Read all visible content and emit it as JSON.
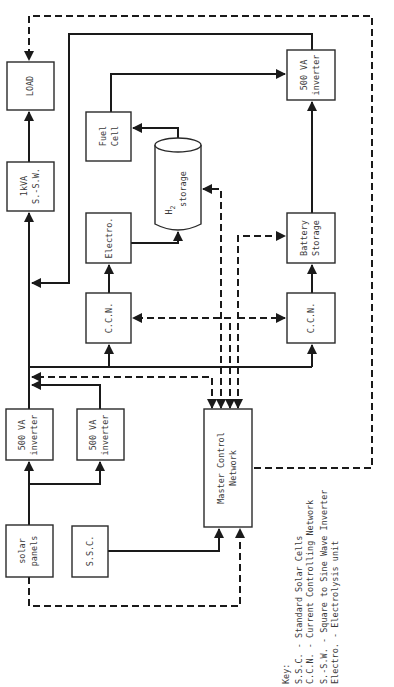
{
  "diagram": {
    "orientation": "rotated 90 degrees counter-clockwise",
    "blocks": {
      "load": {
        "line1": "LOAD"
      },
      "sine_inverter": {
        "line1": "1kVA",
        "line2": "S.-S.W."
      },
      "fuel_cell": {
        "line1": "Fuel",
        "line2": "Cell"
      },
      "h2_storage": {
        "line1": "H",
        "sub": "2",
        "line2": "storage"
      },
      "electrolysis": {
        "line1": "Electro."
      },
      "ccn_left": {
        "line1": "C.C.N."
      },
      "inverter_top": {
        "line1": "500 VA",
        "line2": "inverter"
      },
      "battery": {
        "line1": "Battery",
        "line2": "Storage"
      },
      "ccn_right": {
        "line1": "C.C.N."
      },
      "inverter_a": {
        "line1": "500 VA",
        "line2": "inverter"
      },
      "inverter_b": {
        "line1": "500 VA",
        "line2": "inverter"
      },
      "master_control": {
        "line1": "Master Control",
        "line2": "Network"
      },
      "solar_panels": {
        "line1": "solar",
        "line2": "panels"
      },
      "ssc": {
        "line1": "S.S.C."
      }
    },
    "connections": [
      {
        "from": "solar_panels",
        "to": "inverter_a",
        "type": "power"
      },
      {
        "from": "solar_panels",
        "to": "inverter_b",
        "type": "power"
      },
      {
        "from": "inverter_a",
        "to": "dc_bus",
        "type": "power"
      },
      {
        "from": "inverter_b",
        "to": "dc_bus",
        "type": "power"
      },
      {
        "from": "dc_bus",
        "to": "ccn_left",
        "type": "power"
      },
      {
        "from": "dc_bus",
        "to": "ccn_right",
        "type": "power"
      },
      {
        "from": "ccn_left",
        "to": "electrolysis",
        "type": "power"
      },
      {
        "from": "electrolysis",
        "to": "h2_storage",
        "type": "power"
      },
      {
        "from": "h2_storage",
        "to": "fuel_cell",
        "type": "power"
      },
      {
        "from": "fuel_cell",
        "to": "inverter_top",
        "type": "power"
      },
      {
        "from": "ccn_right",
        "to": "battery",
        "type": "power"
      },
      {
        "from": "battery",
        "to": "inverter_top",
        "type": "power"
      },
      {
        "from": "inverter_top",
        "to": "sine_inverter",
        "type": "power"
      },
      {
        "from": "sine_inverter",
        "to": "load",
        "type": "power"
      },
      {
        "from": "ssc",
        "to": "master_control",
        "type": "power"
      },
      {
        "from": "solar_panels",
        "to": "master_control",
        "type": "control"
      },
      {
        "from": "master_control",
        "to": "load",
        "type": "control"
      },
      {
        "from": "master_control",
        "to": "ccn_left",
        "type": "control"
      },
      {
        "from": "master_control",
        "to": "ccn_right",
        "type": "control"
      },
      {
        "from": "master_control",
        "to": "battery",
        "type": "control"
      },
      {
        "from": "master_control",
        "to": "h2_storage",
        "type": "control"
      },
      {
        "from": "master_control",
        "to": "dc_bus",
        "type": "control"
      }
    ]
  },
  "key": {
    "heading": "Key:",
    "entries": [
      "S.S.C. - Standard Solar Cells",
      "C.C.N. - Current Controlling Network",
      "S.-S.W. - Square to Sine Wave Inverter",
      "Electro. - Electrolysis unit"
    ]
  }
}
